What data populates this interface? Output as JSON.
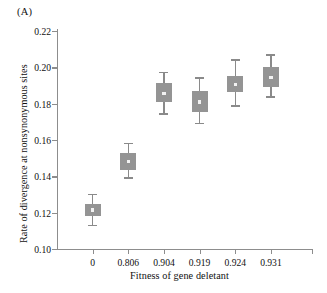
{
  "figure": {
    "panel_label": "(A)",
    "ylabel": "Rate of divergence at nonsynonymous sites",
    "xlabel": "Fitness of gene deletant"
  },
  "chart_data": {
    "type": "box",
    "title": "",
    "panel": "(A)",
    "xlabel": "Fitness of gene deletant",
    "ylabel": "Rate of divergence at nonsynonymous sites",
    "categories": [
      "0",
      "0.806",
      "0.904",
      "0.919",
      "0.924",
      "0.931"
    ],
    "ylim": [
      0.1,
      0.22
    ],
    "ytick_labels": [
      "0.10",
      "0.12",
      "0.14",
      "0.16",
      "0.18",
      "0.20",
      "0.22"
    ],
    "ytick_values": [
      0.1,
      0.12,
      0.14,
      0.16,
      0.18,
      0.2,
      0.22
    ],
    "grid": false,
    "legend": "none",
    "box_color": "#949494",
    "whisker_color": "#8a8a8a",
    "median_marker_color": "#f2f2f2",
    "axis_color": "#8d8d8d",
    "boxes": [
      {
        "category": "0",
        "whisker_low": 0.113,
        "box_low": 0.118,
        "median": 0.1215,
        "box_high": 0.125,
        "whisker_high": 0.13
      },
      {
        "category": "0.806",
        "whisker_low": 0.139,
        "box_low": 0.1435,
        "median": 0.148,
        "box_high": 0.153,
        "whisker_high": 0.158
      },
      {
        "category": "0.904",
        "whisker_low": 0.1742,
        "box_low": 0.1808,
        "median": 0.1855,
        "box_high": 0.1912,
        "whisker_high": 0.1972
      },
      {
        "category": "0.919",
        "whisker_low": 0.169,
        "box_low": 0.1752,
        "median": 0.181,
        "box_high": 0.1868,
        "whisker_high": 0.194
      },
      {
        "category": "0.924",
        "whisker_low": 0.1788,
        "box_low": 0.1862,
        "median": 0.1905,
        "box_high": 0.1955,
        "whisker_high": 0.204
      },
      {
        "category": "0.931",
        "whisker_low": 0.1838,
        "box_low": 0.189,
        "median": 0.1945,
        "box_high": 0.2002,
        "whisker_high": 0.2068
      }
    ]
  }
}
